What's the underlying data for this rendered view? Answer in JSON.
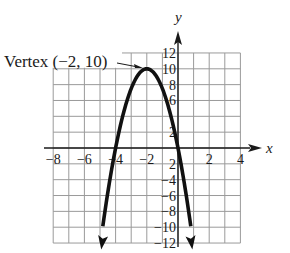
{
  "chart_data": {
    "type": "line",
    "title": "",
    "function": "y = -2.5(x + 2)^2 + 10",
    "xlabel": "x",
    "ylabel": "y",
    "xlim": [
      -8,
      4
    ],
    "ylim": [
      -12,
      12
    ],
    "grid": true,
    "x_step": 1,
    "y_step": 2,
    "x_tick_labels": [
      "-8",
      "-6",
      "-4",
      "-2",
      "2",
      "4"
    ],
    "y_tick_labels": [
      "12",
      "10",
      "8",
      "6",
      "2",
      "2",
      "-4",
      "-6",
      "-8",
      "-10",
      "-12"
    ],
    "series": [
      {
        "name": "parabola",
        "x": [
          -4.8,
          -4,
          -3,
          -2,
          -1,
          0,
          0.8
        ],
        "y": [
          -9.6,
          0,
          7.5,
          10,
          7.5,
          0,
          -9.6
        ],
        "arrows_at_ends": true
      }
    ],
    "annotations": [
      {
        "text": "Vertex (−2, 10)",
        "point": [
          -2,
          10
        ]
      }
    ]
  },
  "labels": {
    "vertex": "Vertex (−2, 10)",
    "x_axis": "x",
    "y_axis": "y",
    "x_ticks": [
      {
        "v": -8,
        "t": "−8"
      },
      {
        "v": -6,
        "t": "−6"
      },
      {
        "v": -4,
        "t": "−4"
      },
      {
        "v": -2,
        "t": "−2"
      },
      {
        "v": 2,
        "t": "2"
      },
      {
        "v": 4,
        "t": "4"
      }
    ],
    "y_ticks": [
      {
        "v": 12,
        "t": "12"
      },
      {
        "v": 10,
        "t": "10"
      },
      {
        "v": 8,
        "t": "8"
      },
      {
        "v": 6,
        "t": "6"
      },
      {
        "v": 2,
        "t": "2"
      },
      {
        "v": -2,
        "t": "2"
      },
      {
        "v": -4,
        "t": "−4"
      },
      {
        "v": -6,
        "t": "−6"
      },
      {
        "v": -8,
        "t": "−8"
      },
      {
        "v": -10,
        "t": "−10"
      },
      {
        "v": -12,
        "t": "−12"
      }
    ]
  },
  "colors": {
    "grid": "#9a9a9a",
    "axis": "#1a1a1a",
    "curve": "#111111"
  }
}
